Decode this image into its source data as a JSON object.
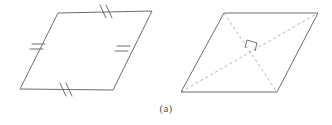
{
  "figure": {
    "caption": "(a)",
    "background_color": "#ffffff",
    "stroke_color": "#6e6e70",
    "tick_color": "#6e6e70",
    "dashed_color": "#b6b6b8",
    "stroke_width": 1,
    "panels": [
      {
        "id": "left-parallelogram",
        "name": "parallelogram-with-congruence-ticks",
        "shape": "parallelogram",
        "vertices": [
          {
            "label": "bottom-left",
            "x": 20,
            "y": 89
          },
          {
            "label": "top-left",
            "x": 58,
            "y": 13
          },
          {
            "label": "top-right",
            "x": 152,
            "y": 11
          },
          {
            "label": "bottom-right",
            "x": 113,
            "y": 90
          }
        ],
        "edges": [
          {
            "name": "top-edge",
            "from": "top-left",
            "to": "top-right",
            "tick_count": 2,
            "tick_style": "double-slash"
          },
          {
            "name": "right-edge",
            "from": "top-right",
            "to": "bottom-right",
            "tick_count": 2,
            "tick_style": "double-bar"
          },
          {
            "name": "bottom-edge",
            "from": "bottom-right",
            "to": "bottom-left",
            "tick_count": 2,
            "tick_style": "double-slash"
          },
          {
            "name": "left-edge",
            "from": "bottom-left",
            "to": "top-left",
            "tick_count": 2,
            "tick_style": "double-bar"
          }
        ],
        "diagonals": []
      },
      {
        "id": "right-rhombus",
        "name": "rhombus-with-perpendicular-diagonals",
        "shape": "rhombus",
        "vertices": [
          {
            "label": "bottom-left",
            "x": 181,
            "y": 92
          },
          {
            "label": "top-left",
            "x": 224,
            "y": 13
          },
          {
            "label": "top-right",
            "x": 318,
            "y": 13
          },
          {
            "label": "bottom-right",
            "x": 277,
            "y": 92
          }
        ],
        "edges": [
          {
            "name": "top-edge",
            "from": "top-left",
            "to": "top-right",
            "tick_count": 0
          },
          {
            "name": "right-edge",
            "from": "top-right",
            "to": "bottom-right",
            "tick_count": 0
          },
          {
            "name": "bottom-edge",
            "from": "bottom-right",
            "to": "bottom-left",
            "tick_count": 0
          },
          {
            "name": "left-edge",
            "from": "bottom-left",
            "to": "top-left",
            "tick_count": 0
          }
        ],
        "diagonals": [
          {
            "name": "diagonal-top-left-to-bottom-right",
            "from": "top-left",
            "to": "bottom-right",
            "style": "dashed"
          },
          {
            "name": "diagonal-bottom-left-to-top-right",
            "from": "bottom-left",
            "to": "top-right",
            "style": "dashed"
          }
        ],
        "angle_markers": [
          {
            "name": "right-angle-marker",
            "type": "right-angle",
            "x": 250,
            "y": 45,
            "degrees": 90
          }
        ]
      }
    ]
  }
}
